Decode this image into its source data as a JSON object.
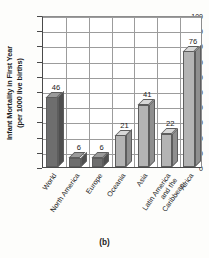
{
  "caption": "(b)",
  "axis": {
    "y_title_lines": [
      "Infant Mortality in First Year",
      "(per 1000 live births)"
    ],
    "y_ticks": [
      "0",
      "10",
      "20",
      "30",
      "40",
      "50",
      "60",
      "70",
      "80",
      "90",
      "100"
    ]
  },
  "colors": {
    "bar_dark_front": "#6e6e6e",
    "bar_dark_top": "#9a9a9a",
    "bar_dark_side": "#4f4f4f",
    "bar_light_front": "#b4b4b4",
    "bar_light_top": "#d8d8d8",
    "bar_light_side": "#8f8f8f",
    "grid": "#9c9c9c",
    "axis": "#4a4a4a",
    "text": "#1b1b1b",
    "background": "#fdfdfb"
  },
  "chart_data": {
    "type": "bar",
    "title": "",
    "xlabel": "",
    "ylabel": "Infant Mortality in First Year (per 1000 live births)",
    "ylim": [
      0,
      100
    ],
    "ytick_step": 10,
    "grid": true,
    "legend": "none",
    "categories": [
      "World",
      "North America",
      "Europe",
      "Oceania",
      "Asia",
      "Latin America and the Caribbean",
      "Africa"
    ],
    "category_label_lines": [
      [
        "World"
      ],
      [
        "North America"
      ],
      [
        "Europe"
      ],
      [
        "Oceania"
      ],
      [
        "Asia"
      ],
      [
        "Latin America",
        "and the",
        "Caribbean"
      ],
      [
        "Africa"
      ]
    ],
    "values": [
      46,
      6,
      6,
      21,
      41,
      22,
      76
    ],
    "value_labels": [
      "46",
      "6",
      "6",
      "21",
      "41",
      "22",
      "76"
    ],
    "bar_shades": [
      "dark",
      "dark",
      "dark",
      "light",
      "light",
      "light",
      "light"
    ]
  }
}
